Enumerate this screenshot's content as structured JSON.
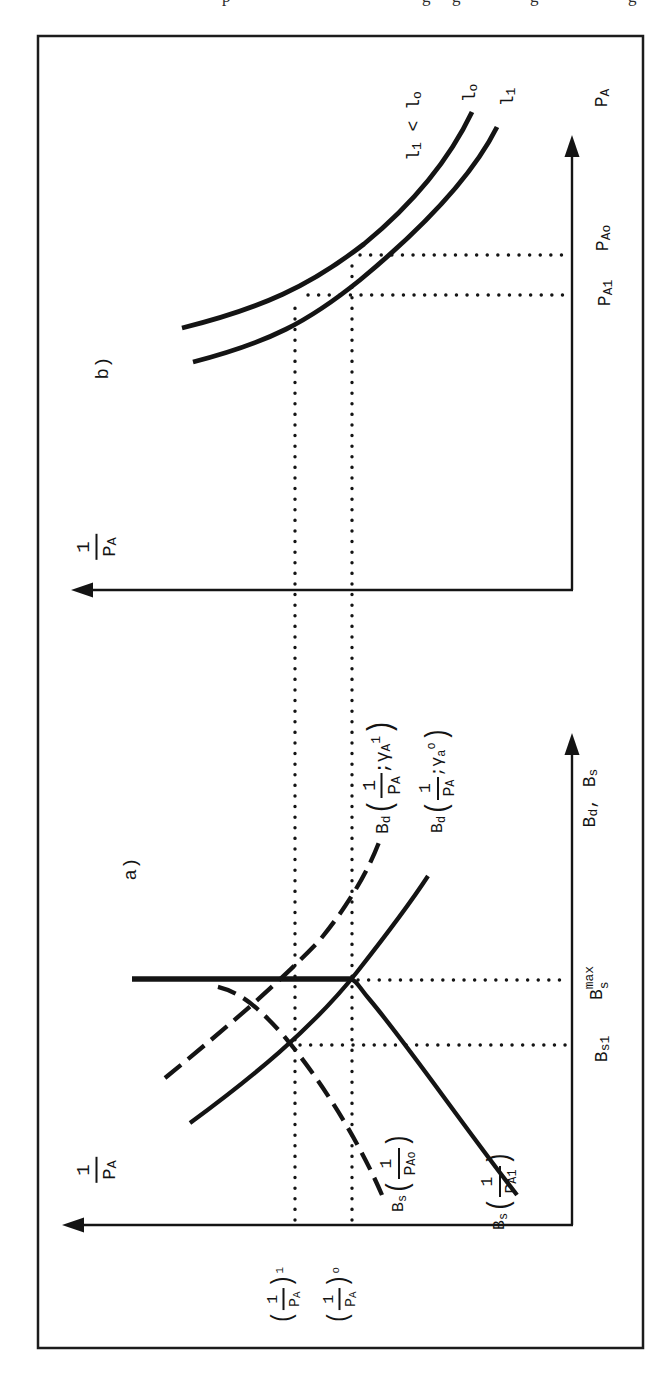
{
  "meta": {
    "ink_color": "#141414",
    "background_color": "#ffffff"
  },
  "top_fragments": [
    "p",
    "g",
    "g",
    "g",
    "g"
  ],
  "figure": {
    "panel_a": {
      "tag": "a)",
      "y_axis_label": {
        "num": "1",
        "den": "P",
        "den_sub": "A"
      },
      "x_axis_label": {
        "b1": "B",
        "b1_sub": "d",
        "sep": ",",
        "b2": "B",
        "b2_sub": "s"
      },
      "y_ticks": {
        "upper": {
          "open": "(",
          "num": "1",
          "den": "P",
          "den_sub": "A",
          "close": ")",
          "sup": "1"
        },
        "lower": {
          "open": "(",
          "num": "1",
          "den": "P",
          "den_sub": "A",
          "close": ")",
          "sup": "o"
        }
      },
      "x_ticks": {
        "bs1": {
          "base": "B",
          "sub": "s1"
        },
        "bsmax": {
          "base": "B",
          "sub": "s",
          "sup": "max"
        }
      },
      "curve_labels": {
        "bd_dashed": {
          "base": "B",
          "sub": "d",
          "open": "(",
          "num": "1",
          "den": "P",
          "den_sub": "A",
          "semi": ";",
          "gamma": "γ",
          "gamma_sub": "A",
          "gamma_sup": "1",
          "close": ")"
        },
        "bd_solid": {
          "base": "B",
          "sub": "d",
          "open": "(",
          "num": "1",
          "den": "P",
          "den_sub": "A",
          "semi": ";",
          "gamma": "γ",
          "gamma_sub": "a",
          "gamma_sup": "o",
          "close": ")"
        },
        "bs_dashed": {
          "base": "B",
          "sub": "s",
          "open": "(",
          "num": "1",
          "den": "P",
          "den_sub": "Ao",
          "close": ")"
        },
        "bs_solid": {
          "base": "B",
          "sub": "s",
          "open": "(",
          "num": "1",
          "den": "P",
          "den_sub": "A1",
          "close": ")"
        }
      }
    },
    "panel_b": {
      "tag": "b)",
      "y_axis_label": {
        "num": "1",
        "den": "P",
        "den_sub": "A"
      },
      "x_axis_label": {
        "base": "P",
        "sub": "A"
      },
      "x_ticks": {
        "pa1": {
          "base": "P",
          "sub": "A1"
        },
        "pao": {
          "base": "P",
          "sub": "Ao"
        }
      },
      "curve_labels": {
        "lo": {
          "base": "l",
          "sub": "o"
        },
        "l1": {
          "base": "l",
          "sub": "1"
        },
        "annotation": {
          "a_base": "l",
          "a_sub": "1",
          "rel": " < ",
          "b_base": "l",
          "b_sub": "o"
        }
      }
    }
  }
}
